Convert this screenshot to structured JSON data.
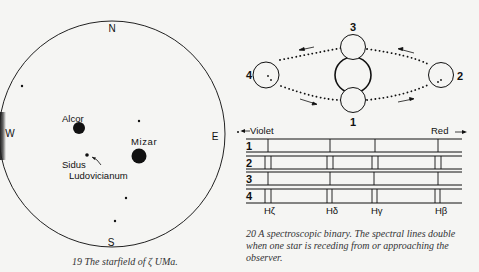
{
  "figure19": {
    "compass": {
      "north": "N",
      "south": "S",
      "east": "E",
      "west": "W"
    },
    "labels": {
      "alcor": "Alcor",
      "mizar": "Mizar",
      "sidus_line1": "Sidus",
      "sidus_line2": "Ludovicianum"
    },
    "caption": "19 The starfield of ζ UMa."
  },
  "figure20": {
    "positions": {
      "p1": "1",
      "p2": "2",
      "p3": "3",
      "p4": "4"
    },
    "spectrum": {
      "violet_label": "Violet",
      "red_label": "Red",
      "rows": [
        "1",
        "2",
        "3",
        "4"
      ],
      "lines": [
        "Hζ",
        "Hδ",
        "Hγ",
        "Hβ"
      ]
    },
    "caption": "20 A spectroscopic binary. The spectral lines double when one star is receding from or approaching the observer."
  }
}
